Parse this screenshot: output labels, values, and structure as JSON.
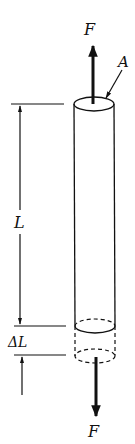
{
  "diagram": {
    "labels": {
      "force_top": "F",
      "force_bottom": "F",
      "area": "A",
      "length": "L",
      "elongation": "ΔL"
    },
    "colors": {
      "ink": "#111111",
      "background": "#ffffff"
    }
  }
}
